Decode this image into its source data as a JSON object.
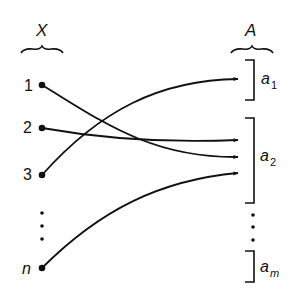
{
  "diagram": {
    "domain_set": {
      "label": "X",
      "elements": [
        "1",
        "2",
        "3",
        "n"
      ]
    },
    "codomain_set": {
      "label": "A",
      "blocks": [
        {
          "name": "a",
          "sub": "1"
        },
        {
          "name": "a",
          "sub": "2"
        },
        {
          "name": "a",
          "sub": "m"
        }
      ]
    },
    "mappings": [
      {
        "from": "1",
        "to": "a2"
      },
      {
        "from": "2",
        "to": "a2"
      },
      {
        "from": "3",
        "to": "a1"
      },
      {
        "from": "n",
        "to": "a2"
      }
    ],
    "ellipsis": "⋮",
    "colors": {
      "ink": "#111111",
      "background": "#ffffff"
    }
  }
}
